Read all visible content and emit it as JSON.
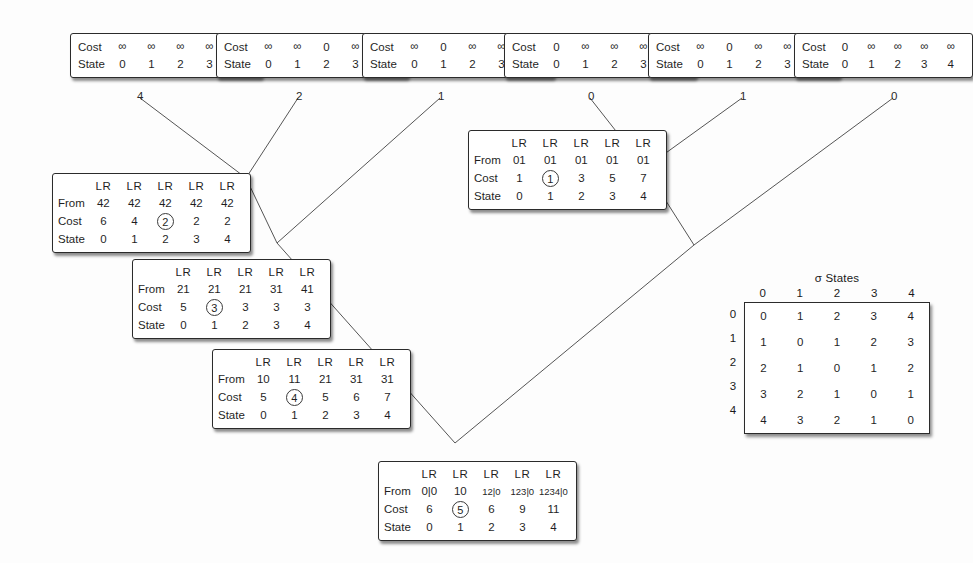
{
  "figure": {
    "infinity_glyph": "∞"
  },
  "leaf_boxes": [
    {
      "name": "leaf-1",
      "row_labels": [
        "Cost",
        "State"
      ],
      "cost": [
        "∞",
        "∞",
        "∞",
        "∞",
        "0"
      ],
      "state": [
        "0",
        "1",
        "2",
        "3",
        "4"
      ]
    },
    {
      "name": "leaf-2",
      "row_labels": [
        "Cost",
        "State"
      ],
      "cost": [
        "∞",
        "∞",
        "0",
        "∞",
        "∞"
      ],
      "state": [
        "0",
        "1",
        "2",
        "3",
        "4"
      ]
    },
    {
      "name": "leaf-3",
      "row_labels": [
        "Cost",
        "State"
      ],
      "cost": [
        "∞",
        "0",
        "∞",
        "∞",
        "∞"
      ],
      "state": [
        "0",
        "1",
        "2",
        "3",
        "4"
      ]
    },
    {
      "name": "leaf-4",
      "row_labels": [
        "Cost",
        "State"
      ],
      "cost": [
        "0",
        "∞",
        "∞",
        "∞",
        "∞"
      ],
      "state": [
        "0",
        "1",
        "2",
        "3",
        "4"
      ]
    },
    {
      "name": "leaf-5",
      "row_labels": [
        "Cost",
        "State"
      ],
      "cost": [
        "∞",
        "0",
        "∞",
        "∞",
        "∞"
      ],
      "state": [
        "0",
        "1",
        "2",
        "3",
        "4"
      ]
    },
    {
      "name": "leaf-6",
      "row_labels": [
        "Cost",
        "State"
      ],
      "cost": [
        "0",
        "∞",
        "∞",
        "∞",
        "∞"
      ],
      "state": [
        "0",
        "1",
        "2",
        "3",
        "4"
      ]
    }
  ],
  "edge_labels": [
    "4",
    "2",
    "1",
    "0",
    "1",
    "0"
  ],
  "node_boxes": [
    {
      "name": "node-cost-2",
      "row_labels": [
        "From",
        "Cost",
        "State"
      ],
      "lr_header": [
        "LR",
        "LR",
        "LR",
        "LR",
        "LR"
      ],
      "from": [
        "42",
        "42",
        "42",
        "42",
        "42"
      ],
      "cost": [
        "6",
        "4",
        "2",
        "2",
        "2"
      ],
      "circled_index": 2,
      "state": [
        "0",
        "1",
        "2",
        "3",
        "4"
      ]
    },
    {
      "name": "node-cost-3",
      "row_labels": [
        "From",
        "Cost",
        "State"
      ],
      "lr_header": [
        "LR",
        "LR",
        "LR",
        "LR",
        "LR"
      ],
      "from": [
        "21",
        "21",
        "21",
        "31",
        "41"
      ],
      "cost": [
        "5",
        "3",
        "3",
        "3",
        "3"
      ],
      "circled_index": 1,
      "state": [
        "0",
        "1",
        "2",
        "3",
        "4"
      ]
    },
    {
      "name": "node-cost-4",
      "row_labels": [
        "From",
        "Cost",
        "State"
      ],
      "lr_header": [
        "LR",
        "LR",
        "LR",
        "LR",
        "LR"
      ],
      "from": [
        "10",
        "11",
        "21",
        "31",
        "31"
      ],
      "cost": [
        "5",
        "4",
        "5",
        "6",
        "7"
      ],
      "circled_index": 1,
      "state": [
        "0",
        "1",
        "2",
        "3",
        "4"
      ]
    },
    {
      "name": "node-cost-1",
      "row_labels": [
        "From",
        "Cost",
        "State"
      ],
      "lr_header": [
        "LR",
        "LR",
        "LR",
        "LR",
        "LR"
      ],
      "from": [
        "01",
        "01",
        "01",
        "01",
        "01"
      ],
      "cost": [
        "1",
        "1",
        "3",
        "5",
        "7"
      ],
      "circled_index": 1,
      "state": [
        "0",
        "1",
        "2",
        "3",
        "4"
      ]
    },
    {
      "name": "node-root",
      "row_labels": [
        "From",
        "Cost",
        "State"
      ],
      "lr_header": [
        "LR",
        "LR",
        "LR",
        "LR",
        "LR"
      ],
      "from": [
        "0|0",
        "10",
        "12|0",
        "123|0",
        "1234|0"
      ],
      "cost": [
        "6",
        "5",
        "6",
        "9",
        "11"
      ],
      "circled_index": 1,
      "state": [
        "0",
        "1",
        "2",
        "3",
        "4"
      ]
    }
  ],
  "sigma": {
    "title": "σ States",
    "col_headers": [
      "0",
      "1",
      "2",
      "3",
      "4"
    ],
    "row_headers": [
      "0",
      "1",
      "2",
      "3",
      "4"
    ],
    "rows": [
      [
        "0",
        "1",
        "2",
        "3",
        "4"
      ],
      [
        "1",
        "0",
        "1",
        "2",
        "3"
      ],
      [
        "2",
        "1",
        "0",
        "1",
        "2"
      ],
      [
        "3",
        "2",
        "1",
        "0",
        "1"
      ],
      [
        "4",
        "3",
        "2",
        "1",
        "0"
      ]
    ]
  },
  "colors": {
    "line": "#555555",
    "border": "#2b2b2b",
    "text": "#1f1f1f",
    "background": "#ffffff"
  }
}
